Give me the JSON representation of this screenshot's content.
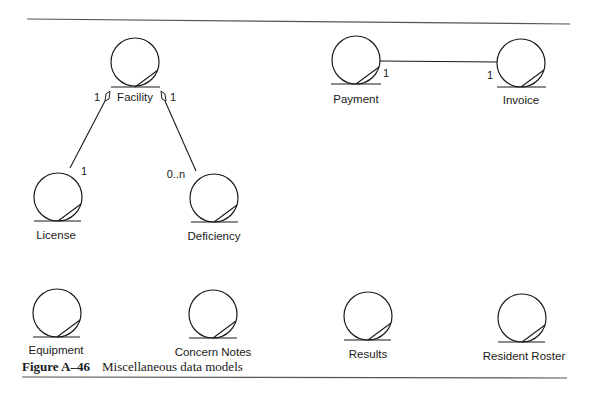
{
  "figure": {
    "number": "Figure A–46",
    "title": "Miscellaneous data models"
  },
  "colors": {
    "ink": "#1a1a1a",
    "rule": "#555555",
    "background": "#ffffff"
  },
  "entities": {
    "facility": "Facility",
    "payment": "Payment",
    "invoice": "Invoice",
    "license": "License",
    "deficiency": "Deficiency",
    "equipment": "Equipment",
    "concern_notes": "Concern Notes",
    "results": "Results",
    "resident_roster": "Resident Roster"
  },
  "relationships": {
    "facility_license": {
      "from": "Facility",
      "to": "License",
      "from_mult": "1",
      "to_mult": "1",
      "kind": "aggregation"
    },
    "facility_deficiency": {
      "from": "Facility",
      "to": "Deficiency",
      "from_mult": "1",
      "to_mult": "0..n",
      "kind": "aggregation"
    },
    "payment_invoice": {
      "from": "Payment",
      "to": "Invoice",
      "from_mult": "1",
      "to_mult": "1",
      "kind": "association"
    }
  }
}
